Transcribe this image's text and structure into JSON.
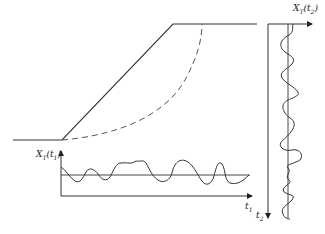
{
  "diagram": {
    "labels": {
      "x_t1_label": "X",
      "x_t1_sub_T": "T",
      "x_t1_arg": "(t",
      "x_t1_arg_sub": "1",
      "x_t1_close": ")",
      "x_t2_label": "X",
      "x_t2_sub_T": "T",
      "x_t2_arg": "(t",
      "x_t2_arg_sub": "2",
      "x_t2_close": ")",
      "t1_axis": "t",
      "t1_sub": "1",
      "t2_axis": "t",
      "t2_sub": "2"
    },
    "elements": {
      "slope_profile": "solid line: toe plateau, inclined face, crest plateau",
      "slip_surface": "dashed curve from toe to crest",
      "signal_t1": "fluctuating curve around a horizontal mean line",
      "signal_t2": "fluctuating curve around a vertical mean line"
    },
    "colors": {
      "line": "#333333",
      "background": "#ffffff"
    }
  }
}
